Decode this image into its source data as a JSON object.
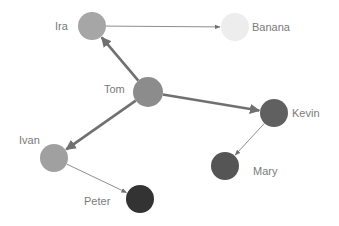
{
  "diagram": {
    "type": "directed-graph",
    "nodes": [
      {
        "id": "ira",
        "label": "Ira",
        "x": 92,
        "y": 26,
        "r": 14,
        "color": "#a6a6a6",
        "label_x": 55,
        "label_y": 20
      },
      {
        "id": "banana",
        "label": "Banana",
        "x": 235,
        "y": 27,
        "r": 14,
        "color": "#ededed",
        "label_x": 252,
        "label_y": 21
      },
      {
        "id": "tom",
        "label": "Tom",
        "x": 148,
        "y": 92,
        "r": 15,
        "color": "#8c8c8c",
        "label_x": 104,
        "label_y": 83
      },
      {
        "id": "kevin",
        "label": "Kevin",
        "x": 274,
        "y": 113,
        "r": 14,
        "color": "#606060",
        "label_x": 292,
        "label_y": 107
      },
      {
        "id": "mary",
        "label": "Mary",
        "x": 225,
        "y": 166,
        "r": 14,
        "color": "#555555",
        "label_x": 253,
        "label_y": 165
      },
      {
        "id": "ivan",
        "label": "Ivan",
        "x": 54,
        "y": 158,
        "r": 14,
        "color": "#a0a0a0",
        "label_x": 19,
        "label_y": 134
      },
      {
        "id": "peter",
        "label": "Peter",
        "x": 140,
        "y": 199,
        "r": 14,
        "color": "#333333",
        "label_x": 84,
        "label_y": 195
      }
    ],
    "edges": [
      {
        "from": "ira",
        "to": "banana",
        "weight": "thin"
      },
      {
        "from": "tom",
        "to": "ira",
        "weight": "thick"
      },
      {
        "from": "tom",
        "to": "kevin",
        "weight": "thick"
      },
      {
        "from": "tom",
        "to": "ivan",
        "weight": "thick"
      },
      {
        "from": "kevin",
        "to": "mary",
        "weight": "thin"
      },
      {
        "from": "ivan",
        "to": "peter",
        "weight": "thin"
      }
    ],
    "edge_color": "#707070"
  }
}
